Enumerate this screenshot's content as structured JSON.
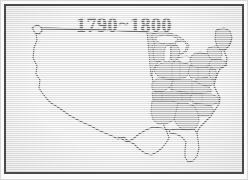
{
  "image": {
    "kind": "scanned-historical-map",
    "width": 248,
    "height": 180
  },
  "frame": {
    "outer_color": "#d9d9d9",
    "inner_color": "#4a4a4a",
    "paper_color": "#efefef"
  },
  "map": {
    "title": "1790~1800",
    "title_year_start": "1790",
    "title_separator": "~",
    "title_year_end": "1800",
    "subject": "United States",
    "outline_color": "#1c1c1c",
    "statehood_fill": "#a9a9a9",
    "statehood_fill_dark": "#8e8e8e",
    "territory_fill": "#ededed",
    "lake_fill": "#f4f4f4",
    "border_line_color": "#2b2b2b",
    "regions": [
      {
        "name": "western-territory",
        "label": "Unorganized Western Territory",
        "shaded": false
      },
      {
        "name": "maine",
        "label": "Maine (District of Massachusetts)",
        "shaded": true
      },
      {
        "name": "new-hampshire",
        "label": "New Hampshire",
        "shaded": true
      },
      {
        "name": "vermont",
        "label": "Vermont",
        "shaded": true
      },
      {
        "name": "massachusetts",
        "label": "Massachusetts",
        "shaded": true
      },
      {
        "name": "new-york",
        "label": "New York",
        "shaded": true
      },
      {
        "name": "pennsylvania",
        "label": "Pennsylvania",
        "shaded": true
      },
      {
        "name": "new-jersey",
        "label": "New Jersey",
        "shaded": true
      },
      {
        "name": "maryland-delaware",
        "label": "Maryland and Delaware",
        "shaded": true
      },
      {
        "name": "virginia",
        "label": "Virginia",
        "shaded": true
      },
      {
        "name": "north-carolina",
        "label": "North Carolina",
        "shaded": true
      },
      {
        "name": "south-carolina",
        "label": "South Carolina",
        "shaded": true
      },
      {
        "name": "georgia",
        "label": "Georgia",
        "shaded": true
      },
      {
        "name": "kentucky",
        "label": "Kentucky",
        "shaded": true
      },
      {
        "name": "tennessee",
        "label": "Tennessee",
        "shaded": true,
        "emphasis": true
      },
      {
        "name": "ohio-northwest",
        "label": "Northwest Territory",
        "shaded": true
      },
      {
        "name": "mississippi-territory",
        "label": "Mississippi Territory",
        "shaded": true
      },
      {
        "name": "florida-peninsula",
        "label": "Florida",
        "shaded": false
      }
    ],
    "great_lakes": [
      {
        "name": "lake-superior",
        "label": "Lake Superior"
      },
      {
        "name": "lake-michigan",
        "label": "Lake Michigan"
      },
      {
        "name": "lake-huron",
        "label": "Lake Huron"
      },
      {
        "name": "lake-erie",
        "label": "Lake Erie"
      },
      {
        "name": "lake-ontario",
        "label": "Lake Ontario"
      }
    ]
  }
}
